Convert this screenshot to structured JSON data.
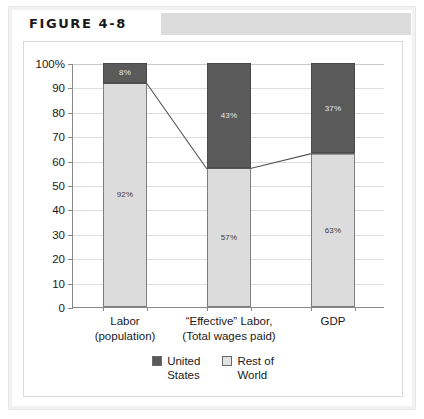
{
  "figure": {
    "title": "FIGURE 4-8"
  },
  "chart_data": {
    "type": "bar",
    "subtype": "stacked-100-percent",
    "title": "",
    "xlabel": "",
    "ylabel": "",
    "ylim": [
      0,
      100
    ],
    "ytick_values": [
      0,
      10,
      20,
      30,
      40,
      50,
      60,
      70,
      80,
      90,
      100
    ],
    "ytick_labels": [
      "0",
      "10",
      "20",
      "30",
      "40",
      "50",
      "60",
      "70",
      "80",
      "90",
      "100%"
    ],
    "grid": true,
    "legend_position": "bottom-center",
    "categories": [
      "Labor (population)",
      "“Effective” Labor, (Total wages paid)",
      "GDP"
    ],
    "category_lines": [
      [
        "Labor",
        "(population)"
      ],
      [
        "“Effective” Labor,",
        "(Total wages paid)"
      ],
      [
        "GDP",
        ""
      ]
    ],
    "series": [
      {
        "name": "United States",
        "name_lines": [
          "United",
          "States"
        ],
        "color": "#5a5a5a",
        "values": [
          8,
          43,
          37
        ],
        "value_labels": [
          "8%",
          "43%",
          "37%"
        ]
      },
      {
        "name": "Rest of World",
        "name_lines": [
          "Rest of",
          "World"
        ],
        "color": "#dcdcdc",
        "values": [
          92,
          57,
          63
        ],
        "value_labels": [
          "92%",
          "57%",
          "63%"
        ]
      }
    ],
    "connector_line": {
      "description": "line joining the boundary between Rest of World and United States across the three bars",
      "values": [
        92,
        57,
        63
      ],
      "color": "#555555"
    }
  }
}
